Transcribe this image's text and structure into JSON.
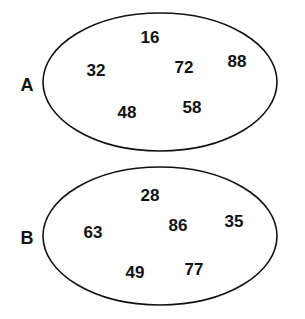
{
  "sets": [
    {
      "label": "A",
      "elements": [
        "16",
        "32",
        "72",
        "88",
        "48",
        "58"
      ]
    },
    {
      "label": "B",
      "elements": [
        "28",
        "63",
        "86",
        "35",
        "49",
        "77"
      ]
    }
  ]
}
